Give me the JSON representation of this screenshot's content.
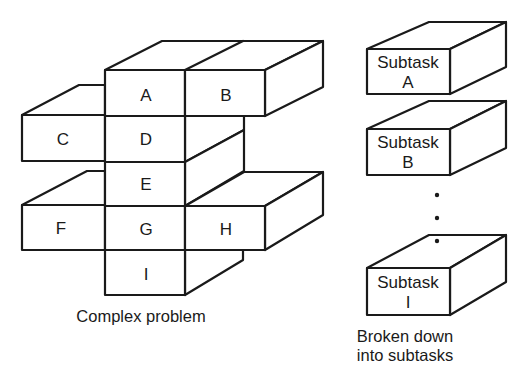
{
  "diagram": {
    "complex_problem": {
      "caption": "Complex problem",
      "cells": [
        {
          "id": "A",
          "label": "A"
        },
        {
          "id": "B",
          "label": "B"
        },
        {
          "id": "C",
          "label": "C"
        },
        {
          "id": "D",
          "label": "D"
        },
        {
          "id": "E",
          "label": "E"
        },
        {
          "id": "F",
          "label": "F"
        },
        {
          "id": "G",
          "label": "G"
        },
        {
          "id": "H",
          "label": "H"
        },
        {
          "id": "I",
          "label": "I"
        }
      ]
    },
    "subtasks": {
      "caption_line1": "Broken down",
      "caption_line2": "into subtasks",
      "items": [
        {
          "line1": "Subtask",
          "line2": "A"
        },
        {
          "line1": "Subtask",
          "line2": "B"
        },
        {
          "line1": "Subtask",
          "line2": "I"
        }
      ],
      "ellipsis": "⋮"
    },
    "colors": {
      "stroke": "#1a1a1a",
      "background": "#ffffff"
    }
  }
}
